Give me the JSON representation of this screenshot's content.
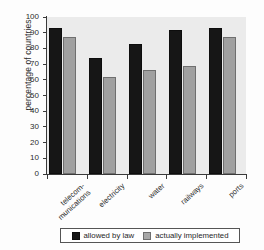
{
  "chart_data": {
    "type": "bar",
    "title": "",
    "xlabel": "",
    "ylabel": "percentage of countries",
    "ylim": [
      0,
      100
    ],
    "ytick_values": [
      100,
      90,
      80,
      70,
      60,
      50,
      40,
      30,
      20,
      10,
      0
    ],
    "ytick_labels": [
      "100",
      "90",
      "80",
      "70",
      "60",
      "50",
      "40",
      "30",
      "20",
      "10",
      "0"
    ],
    "grid": false,
    "legend_position": "bottom-center",
    "categories": [
      "telecom-munications",
      "electricity",
      "water",
      "railways",
      "ports"
    ],
    "category_lines": [
      [
        "telecom-",
        "munications"
      ],
      [
        "electricity"
      ],
      [
        "water"
      ],
      [
        "railways"
      ],
      [
        "ports"
      ]
    ],
    "series": [
      {
        "name": "allowed by law",
        "color": "#161616",
        "values": [
          93,
          74,
          83,
          92,
          93
        ]
      },
      {
        "name": "actually implemented",
        "color": "#a0a0a0",
        "values": [
          87,
          62,
          66,
          69,
          87
        ]
      }
    ]
  },
  "legend": {
    "entries": [
      {
        "label": "allowed by law"
      },
      {
        "label": "actually implemented"
      }
    ]
  }
}
